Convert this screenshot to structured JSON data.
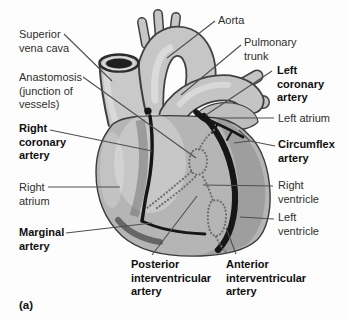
{
  "panel": {
    "label": "(a)"
  },
  "colors": {
    "background": "#fdfdfd",
    "leader_line": "#4f4f4f",
    "text_regular": "#2f2f2f",
    "text_bold": "#0f0f0f",
    "heart_body": "#b5b5b5",
    "vessel_light": "#c6c6c6",
    "artery_dark": "#161616",
    "anastomosis_dots": "#6d6d6d"
  },
  "anatomy_parts": [
    "superior-vena-cava",
    "aorta",
    "aortic-arch-branches",
    "pulmonary-trunk",
    "left-atrium",
    "heart-body",
    "right-coronary-artery",
    "marginal-artery",
    "left-coronary-artery",
    "circumflex-artery",
    "anterior-interventricular-artery",
    "posterior-interventricular-artery",
    "anastomosis-vessels"
  ],
  "labels": [
    {
      "id": "superior-vena-cava",
      "lines": [
        "Superior",
        "vena cava"
      ],
      "bold": false,
      "x": 19,
      "y": 28,
      "leaders": [
        [
          64,
          34,
          112,
          81
        ]
      ]
    },
    {
      "id": "anastomosis",
      "lines": [
        "Anastomosis",
        "(junction of",
        "vessels)"
      ],
      "bold": false,
      "x": 19,
      "y": 71,
      "leaders": [
        [
          83,
          77,
          196,
          158
        ]
      ]
    },
    {
      "id": "right-coronary-artery",
      "lines": [
        "Right",
        "coronary",
        "artery"
      ],
      "bold": true,
      "x": 19,
      "y": 122,
      "leaders": [
        [
          50,
          130,
          152,
          151
        ]
      ]
    },
    {
      "id": "right-atrium",
      "lines": [
        "Right",
        "atrium"
      ],
      "bold": false,
      "x": 19,
      "y": 181,
      "leaders": [
        [
          48,
          187,
          120,
          187
        ]
      ]
    },
    {
      "id": "marginal-artery",
      "lines": [
        "Marginal",
        "artery"
      ],
      "bold": true,
      "x": 19,
      "y": 226,
      "leaders": [
        [
          66,
          233,
          152,
          223
        ]
      ]
    },
    {
      "id": "aorta",
      "lines": [
        "Aorta"
      ],
      "bold": false,
      "x": 218,
      "y": 14,
      "leaders": [
        [
          215,
          21,
          167,
          58
        ]
      ]
    },
    {
      "id": "pulmonary-trunk",
      "lines": [
        "Pulmonary",
        "trunk"
      ],
      "bold": false,
      "x": 244,
      "y": 36,
      "leaders": [
        [
          241,
          45,
          181,
          95
        ]
      ]
    },
    {
      "id": "left-coronary-artery",
      "lines": [
        "Left",
        "coronary",
        "artery"
      ],
      "bold": true,
      "x": 277,
      "y": 64,
      "leaders": [
        [
          272,
          71,
          206,
          115
        ]
      ]
    },
    {
      "id": "left-atrium",
      "lines": [
        "Left atrium"
      ],
      "bold": false,
      "x": 278,
      "y": 112,
      "leaders": [
        [
          274,
          118,
          219,
          118
        ]
      ]
    },
    {
      "id": "circumflex-artery",
      "lines": [
        "Circumflex",
        "artery"
      ],
      "bold": true,
      "x": 278,
      "y": 138,
      "leaders": [
        [
          275,
          146,
          250,
          141
        ],
        [
          250,
          141,
          239,
          130
        ],
        [
          250,
          141,
          234,
          143
        ]
      ]
    },
    {
      "id": "right-ventricle",
      "lines": [
        "Right",
        "ventricle"
      ],
      "bold": false,
      "x": 278,
      "y": 179,
      "leaders": [
        [
          273,
          186,
          203,
          185
        ]
      ]
    },
    {
      "id": "left-ventricle",
      "lines": [
        "Left",
        "ventricle"
      ],
      "bold": false,
      "x": 278,
      "y": 211,
      "leaders": [
        [
          274,
          219,
          240,
          217
        ]
      ]
    },
    {
      "id": "posterior-interventricular-artery",
      "lines": [
        "Posterior",
        "interventricular",
        "artery"
      ],
      "bold": true,
      "x": 131,
      "y": 258,
      "leaders": [
        [
          152,
          255,
          197,
          196
        ]
      ]
    },
    {
      "id": "anterior-interventricular-artery",
      "lines": [
        "Anterior",
        "interventricular",
        "artery"
      ],
      "bold": true,
      "x": 226,
      "y": 258,
      "leaders": [
        [
          236,
          254,
          226,
          228
        ]
      ]
    }
  ]
}
